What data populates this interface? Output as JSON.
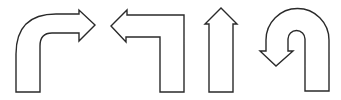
{
  "diagram": {
    "background": "#ffffff",
    "stroke_color": "#2a2a2a",
    "fill_color": "#ffffff",
    "arrows": [
      {
        "name": "turn-right",
        "label": "Turn right arrow"
      },
      {
        "name": "turn-left",
        "label": "Turn left arrow"
      },
      {
        "name": "straight",
        "label": "Straight ahead arrow"
      },
      {
        "name": "u-turn",
        "label": "U-turn arrow"
      }
    ]
  }
}
